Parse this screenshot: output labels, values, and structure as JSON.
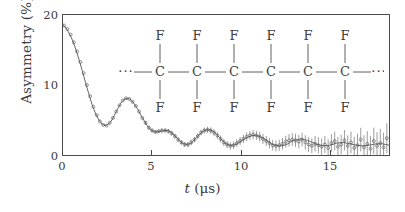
{
  "figure": {
    "kind": "muon-spin-rotation-asymmetry-plot",
    "background_color": "#ffffff",
    "axis_color": "#4a4a4a",
    "data_color": "#555555"
  },
  "axes": {
    "y_label": "Asymmetry (%)",
    "x_label_italic": "t",
    "x_label_unit": " (μs)",
    "y_ticks": [
      "0",
      "10",
      "20"
    ],
    "x_ticks": [
      "0",
      "5",
      "10",
      "15"
    ]
  },
  "molecule": {
    "name": "ptfe-chain",
    "left_ellipsis": "···",
    "right_ellipsis": "···",
    "backbone_atom": "C",
    "substituent_atom": "F",
    "repeat_units": 6,
    "top_labels": [
      "F",
      "F",
      "F",
      "F",
      "F",
      "F"
    ],
    "backbone_labels": [
      "C",
      "C",
      "C",
      "C",
      "C",
      "C"
    ],
    "bottom_labels": [
      "F",
      "F",
      "F",
      "F",
      "F",
      "F"
    ]
  },
  "chart_data": {
    "type": "line",
    "title": "",
    "xlabel": "t (μs)",
    "ylabel": "Asymmetry (%)",
    "xlim": [
      0,
      15
    ],
    "ylim": [
      0,
      20
    ],
    "xticks": [
      0,
      5,
      10,
      15
    ],
    "yticks": [
      0,
      10,
      20
    ],
    "grid": false,
    "legend": null,
    "series": [
      {
        "name": "fit",
        "style": "solid-line",
        "x": [
          0.0,
          0.15,
          0.3,
          0.45,
          0.6,
          0.75,
          0.9,
          1.05,
          1.2,
          1.35,
          1.5,
          1.65,
          1.8,
          1.95,
          2.1,
          2.25,
          2.4,
          2.55,
          2.7,
          2.85,
          3.0,
          3.15,
          3.3,
          3.45,
          3.6,
          3.75,
          3.9,
          4.05,
          4.2,
          4.35,
          4.5,
          4.65,
          4.8,
          4.95,
          5.1,
          5.25,
          5.4,
          5.55,
          5.7,
          5.85,
          6.0,
          6.15,
          6.3,
          6.45,
          6.6,
          6.75,
          6.9,
          7.05,
          7.2,
          7.35,
          7.5,
          7.65,
          7.8,
          7.95,
          8.1,
          8.25,
          8.4,
          8.55,
          8.7,
          8.85,
          9.0,
          9.15,
          9.3,
          9.45,
          9.6,
          9.75,
          9.9,
          10.05,
          10.2,
          10.35,
          10.5,
          10.65,
          10.8,
          10.95,
          11.1,
          11.25,
          11.4,
          11.55,
          11.7,
          11.85,
          12.0,
          12.3,
          12.6,
          12.9,
          13.2,
          13.5,
          13.8,
          14.1,
          14.4,
          14.7,
          15.0
        ],
        "y": [
          18.6,
          18.1,
          17.3,
          16.3,
          15.0,
          13.5,
          11.9,
          10.2,
          8.6,
          7.1,
          5.9,
          5.0,
          4.4,
          4.2,
          4.4,
          5.0,
          5.9,
          6.8,
          7.6,
          8.0,
          8.1,
          7.8,
          7.2,
          6.5,
          5.6,
          4.8,
          4.1,
          3.6,
          3.3,
          3.3,
          3.4,
          3.5,
          3.5,
          3.3,
          2.9,
          2.4,
          1.9,
          1.6,
          1.5,
          1.6,
          2.0,
          2.5,
          3.0,
          3.4,
          3.6,
          3.6,
          3.4,
          3.0,
          2.5,
          2.0,
          1.6,
          1.4,
          1.4,
          1.5,
          1.8,
          2.1,
          2.4,
          2.6,
          2.8,
          2.8,
          2.7,
          2.5,
          2.2,
          1.9,
          1.6,
          1.4,
          1.3,
          1.3,
          1.4,
          1.6,
          1.9,
          2.1,
          2.2,
          2.3,
          2.2,
          2.1,
          1.9,
          1.7,
          1.5,
          1.4,
          1.3,
          1.4,
          1.7,
          1.8,
          1.6,
          1.4,
          1.3,
          1.4,
          1.6,
          1.6,
          1.4
        ]
      },
      {
        "name": "measured-asymmetry",
        "style": "open-circle-markers-with-error-bars",
        "x": [
          0.05,
          0.2,
          0.35,
          0.5,
          0.65,
          0.8,
          0.95,
          1.1,
          1.25,
          1.4,
          1.55,
          1.7,
          1.85,
          2.0,
          2.15,
          2.3,
          2.45,
          2.6,
          2.75,
          2.9,
          3.05,
          3.2,
          3.35,
          3.5,
          3.65,
          3.8,
          3.95,
          4.1,
          4.25,
          4.4,
          4.55,
          4.7,
          4.85,
          5.0,
          5.15,
          5.3,
          5.45,
          5.6,
          5.75,
          5.9,
          6.05,
          6.2,
          6.35,
          6.5,
          6.65,
          6.8,
          6.95,
          7.1,
          7.25,
          7.4,
          7.55,
          7.7,
          7.85,
          8.0,
          8.15,
          8.3,
          8.45,
          8.6,
          8.75,
          8.9,
          9.05,
          9.2,
          9.35,
          9.5,
          9.65,
          9.8,
          9.95,
          10.1,
          10.25,
          10.4,
          10.55,
          10.7,
          10.85,
          11.0,
          11.15,
          11.3,
          11.45,
          11.6,
          11.75,
          11.9,
          12.05,
          12.2,
          12.35,
          12.5,
          12.65,
          12.8,
          12.95,
          13.1,
          13.25,
          13.4,
          13.55,
          13.7,
          13.85,
          14.0,
          14.15,
          14.3,
          14.45,
          14.6,
          14.75,
          14.9
        ],
        "y": [
          18.5,
          18.0,
          17.2,
          16.1,
          14.8,
          13.3,
          11.7,
          10.0,
          8.4,
          6.9,
          5.7,
          4.8,
          4.3,
          4.2,
          4.6,
          5.3,
          6.2,
          7.1,
          7.8,
          8.1,
          8.0,
          7.6,
          7.0,
          6.2,
          5.3,
          4.6,
          3.9,
          3.5,
          3.3,
          3.4,
          3.5,
          3.5,
          3.4,
          3.1,
          2.7,
          2.2,
          1.8,
          1.5,
          1.5,
          1.8,
          2.2,
          2.7,
          3.2,
          3.5,
          3.6,
          3.5,
          3.2,
          2.8,
          2.3,
          1.8,
          1.5,
          1.3,
          1.4,
          1.7,
          2.0,
          2.3,
          2.6,
          2.8,
          2.9,
          2.8,
          2.6,
          2.3,
          2.0,
          1.7,
          1.4,
          1.3,
          1.4,
          1.6,
          1.9,
          2.1,
          2.2,
          2.1,
          1.9,
          2.2,
          1.8,
          1.5,
          1.3,
          1.6,
          1.4,
          1.2,
          1.5,
          1.0,
          1.7,
          2.0,
          1.2,
          1.5,
          2.1,
          1.3,
          1.8,
          1.0,
          1.4,
          2.2,
          1.1,
          1.6,
          0.9,
          2.0,
          1.3,
          1.7,
          1.1,
          2.4
        ],
        "error": [
          0.15,
          0.15,
          0.15,
          0.15,
          0.16,
          0.16,
          0.16,
          0.17,
          0.17,
          0.17,
          0.18,
          0.18,
          0.19,
          0.19,
          0.2,
          0.2,
          0.21,
          0.21,
          0.22,
          0.22,
          0.23,
          0.23,
          0.24,
          0.25,
          0.25,
          0.26,
          0.27,
          0.27,
          0.28,
          0.29,
          0.3,
          0.3,
          0.31,
          0.32,
          0.33,
          0.34,
          0.35,
          0.36,
          0.37,
          0.38,
          0.39,
          0.4,
          0.41,
          0.42,
          0.43,
          0.45,
          0.46,
          0.47,
          0.48,
          0.5,
          0.51,
          0.53,
          0.54,
          0.56,
          0.57,
          0.59,
          0.61,
          0.62,
          0.64,
          0.66,
          0.68,
          0.7,
          0.72,
          0.74,
          0.76,
          0.79,
          0.81,
          0.83,
          0.86,
          0.88,
          0.91,
          0.94,
          0.96,
          0.99,
          1.02,
          1.05,
          1.08,
          1.12,
          1.15,
          1.18,
          1.22,
          1.26,
          1.29,
          1.33,
          1.37,
          1.41,
          1.46,
          1.5,
          1.55,
          1.59,
          1.64,
          1.69,
          1.74,
          1.8,
          1.85,
          1.91,
          1.97,
          2.03,
          2.09,
          2.15
        ]
      }
    ]
  }
}
